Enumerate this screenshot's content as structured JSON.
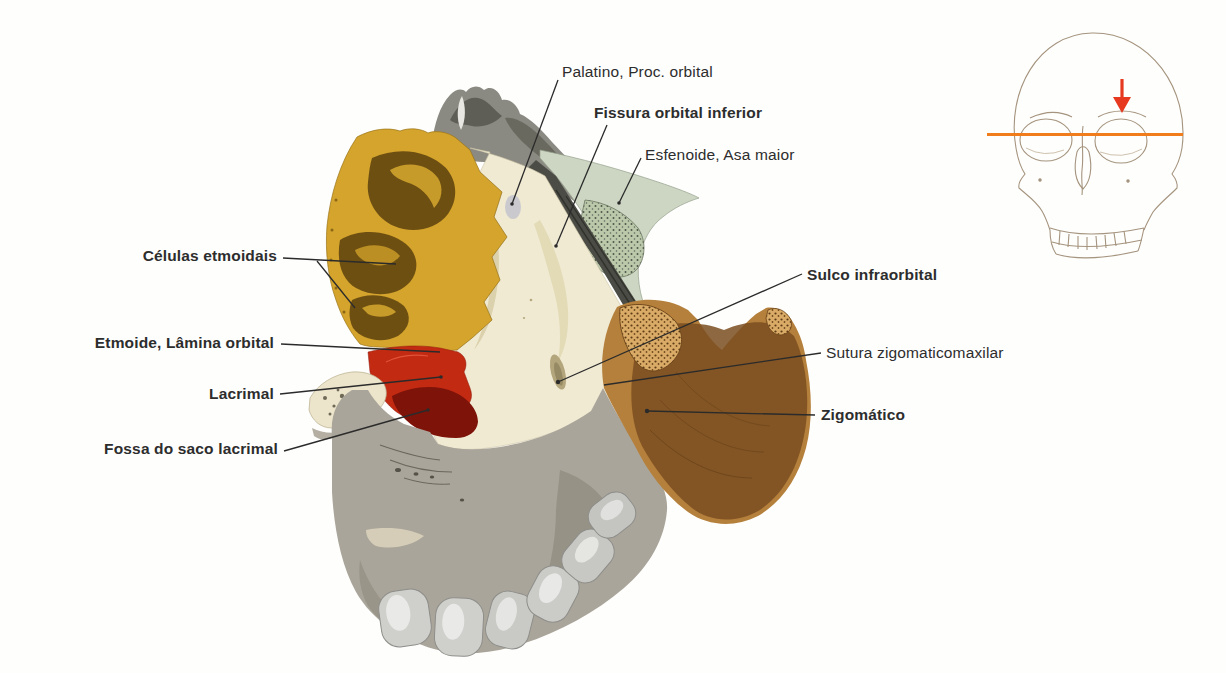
{
  "figure": {
    "type": "anatomical-illustration",
    "labels": {
      "palatino": {
        "text": "Palatino, Proc. orbital",
        "bold": false
      },
      "fissura": {
        "text": "Fissura orbital inferior",
        "bold": true
      },
      "esfenoide": {
        "text": "Esfenoide, Asa maior",
        "bold": false
      },
      "celulas": {
        "text": "Células etmoidais",
        "bold": true
      },
      "etmoide": {
        "text": "Etmoide, Lâmina orbital",
        "bold": true
      },
      "lacrimal": {
        "text": "Lacrimal",
        "bold": true
      },
      "fossa": {
        "text": "Fossa do saco lacrimal",
        "bold": true
      },
      "sulco": {
        "text": "Sulco infraorbital",
        "bold": true
      },
      "sutura": {
        "text": "Sutura zigomaticomaxilar",
        "bold": false
      },
      "zigomatico": {
        "text": "Zigomático",
        "bold": true
      }
    },
    "bone_colors": {
      "ethmoid": "#d4a42c",
      "ethmoid_cells": "#6e4f12",
      "lacrimal": "#c22a12",
      "lacrimal_fossa": "#7e130a",
      "sphenoid": "#ccd6c2",
      "zygomatic": "#b5803c",
      "zygomatic_dark": "#7a4e20",
      "maxilla_orbital": "#f0ead3",
      "maxilla_body": "#aaa59a",
      "bone_gray_top": "#8b8a82"
    },
    "leader_line_color": "#2b2b2b",
    "inset": {
      "type": "orientation-skull-frontal",
      "line_color": "#f07c1c",
      "arrow_color": "#e6391f",
      "outline_color": "#a5947e"
    }
  }
}
